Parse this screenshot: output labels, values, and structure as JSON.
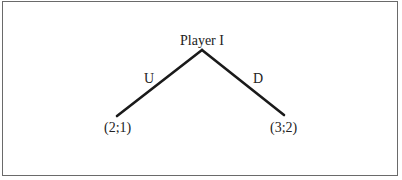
{
  "diagram": {
    "type": "game-tree",
    "root": {
      "label": "Player I"
    },
    "branches": [
      {
        "action": "U",
        "payoff": "(2;1)"
      },
      {
        "action": "D",
        "payoff": "(3;2)"
      }
    ],
    "colors": {
      "line": "#1a1a1a",
      "text": "#222222",
      "frame": "#6a6a6a"
    }
  }
}
